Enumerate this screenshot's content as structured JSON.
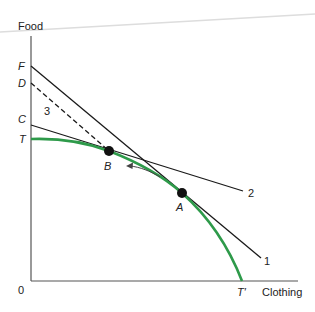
{
  "diagram": {
    "type": "production-possibility-frontier",
    "axes": {
      "y_label": "Food",
      "x_label": "Clothing",
      "origin_label": "0"
    },
    "intercepts": {
      "F": "F",
      "D": "D",
      "C": "C",
      "T": "T",
      "T_prime": "T′"
    },
    "points": {
      "A": "A",
      "B": "B"
    },
    "lines": {
      "line1": "1",
      "line2": "2",
      "line3": "3"
    },
    "colors": {
      "frontier": "#2e9a4a",
      "lines": "#1a1a1a",
      "axes": "#555555",
      "arrow": "#444444"
    }
  }
}
